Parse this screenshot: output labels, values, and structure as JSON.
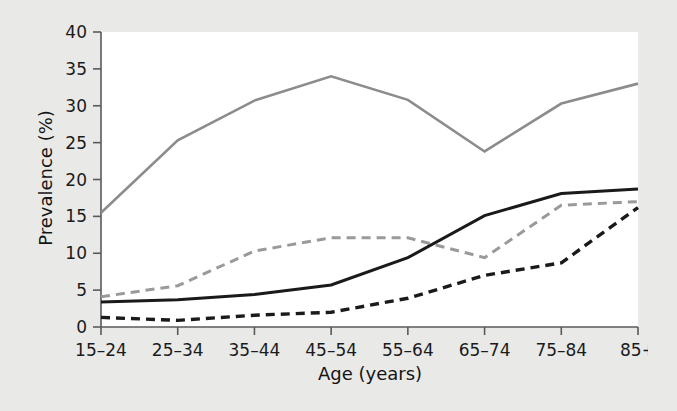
{
  "figure": {
    "background_color": "#e9e9e7",
    "plot_background_color": "#ffffff",
    "axis_color": "#5a5a5a"
  },
  "chart_data": {
    "type": "line",
    "title": "",
    "subtitle": "",
    "xlabel": "Age (years)",
    "ylabel": "Prevalence (%)",
    "categories": [
      "15–24",
      "25–34",
      "35–44",
      "45–54",
      "55–64",
      "65–74",
      "75–84",
      "85+"
    ],
    "x_tick_labels": [
      "15–24",
      "25–34",
      "35–44",
      "45–54",
      "55–64",
      "65–74",
      "75–84",
      "85+"
    ],
    "y_tick_labels": [
      "0",
      "5",
      "10",
      "15",
      "20",
      "25",
      "30",
      "35",
      "40"
    ],
    "y_ticks": [
      0,
      5,
      10,
      15,
      20,
      25,
      30,
      35,
      40
    ],
    "ylim": [
      0,
      40
    ],
    "grid": false,
    "legend": false,
    "legend_position": "none",
    "annotations": [],
    "series": [
      {
        "name": "series-1-gray-solid",
        "style": "solid",
        "color": "#8c8c8c",
        "line_width": 2.6,
        "values": [
          15.5,
          25.3,
          30.7,
          34.0,
          30.8,
          23.8,
          30.3,
          33.0
        ]
      },
      {
        "name": "series-2-gray-dashed",
        "style": "dashed",
        "color": "#9a9a9a",
        "line_width": 3.0,
        "dash": "9,6",
        "values": [
          4.1,
          5.6,
          10.3,
          12.1,
          12.1,
          9.4,
          16.5,
          17.0
        ]
      },
      {
        "name": "series-3-black-solid",
        "style": "solid",
        "color": "#1a1a1a",
        "line_width": 3.0,
        "values": [
          3.4,
          3.7,
          4.4,
          5.7,
          9.4,
          15.1,
          18.1,
          18.7
        ]
      },
      {
        "name": "series-4-black-dashed",
        "style": "dashed",
        "color": "#1a1a1a",
        "line_width": 3.4,
        "dash": "9,6",
        "values": [
          1.3,
          0.9,
          1.6,
          2.0,
          3.9,
          7.0,
          8.7,
          16.2
        ]
      }
    ]
  }
}
